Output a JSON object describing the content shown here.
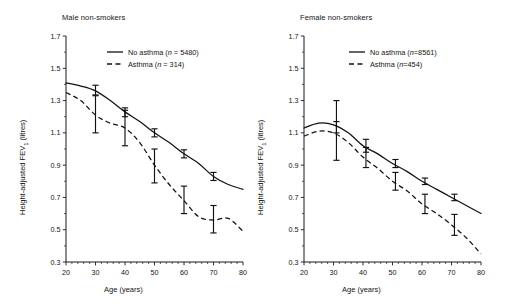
{
  "figure": {
    "panels": [
      {
        "id": "male",
        "title": "Male non-smokers",
        "xlabel": "Age (years)",
        "ylabel_prefix": "Height-adjusted FEV",
        "ylabel_sub": "1",
        "ylabel_suffix": " (litres)",
        "legend": [
          {
            "label": "No asthma (",
            "n_italic": "n",
            "n_value": " = 5480)",
            "style": "solid"
          },
          {
            "label": "Asthma (",
            "n_italic": "n",
            "n_value": " = 314)",
            "style": "dashed"
          }
        ]
      },
      {
        "id": "female",
        "title": "Female non-smokers",
        "xlabel": "Age (years)",
        "ylabel_prefix": "Height-adjusted FEV",
        "ylabel_sub": "1",
        "ylabel_suffix": " (litres)",
        "legend": [
          {
            "label": "No asthma (",
            "n_italic": "n",
            "n_value": "=8561)",
            "style": "solid"
          },
          {
            "label": "Asthma (",
            "n_italic": "n",
            "n_value": "=454)",
            "style": "dashed"
          }
        ]
      }
    ]
  },
  "chart_data": [
    {
      "type": "line",
      "title": "Male non-smokers",
      "xlabel": "Age (years)",
      "ylabel": "Height-adjusted FEV1 (litres)",
      "xlim": [
        20,
        80
      ],
      "ylim": [
        0.3,
        1.7
      ],
      "xticks": [
        20,
        30,
        40,
        50,
        60,
        70,
        80
      ],
      "yticks": [
        0.3,
        0.5,
        0.7,
        0.9,
        1.1,
        1.3,
        1.5,
        1.7
      ],
      "minor_tick_step": 2,
      "grid": false,
      "legend_position": "top-right-inside",
      "series": [
        {
          "name": "No asthma (n = 5480)",
          "style": "solid",
          "x": [
            20,
            25,
            30,
            35,
            40,
            45,
            50,
            55,
            60,
            65,
            70,
            75,
            80
          ],
          "y": [
            1.41,
            1.39,
            1.36,
            1.3,
            1.23,
            1.17,
            1.1,
            1.04,
            0.97,
            0.91,
            0.83,
            0.78,
            0.75
          ],
          "markers": [
            {
              "x": 30,
              "y": 1.36,
              "lo": 1.335,
              "hi": 1.395
            },
            {
              "x": 40,
              "y": 1.23,
              "lo": 1.2,
              "hi": 1.255
            },
            {
              "x": 50,
              "y": 1.1,
              "lo": 1.075,
              "hi": 1.125
            },
            {
              "x": 60,
              "y": 0.97,
              "lo": 0.945,
              "hi": 0.995
            },
            {
              "x": 70,
              "y": 0.83,
              "lo": 0.805,
              "hi": 0.855
            }
          ]
        },
        {
          "name": "Asthma (n = 314)",
          "style": "dashed",
          "x": [
            20,
            25,
            30,
            35,
            40,
            45,
            50,
            55,
            60,
            65,
            70,
            75,
            80
          ],
          "y": [
            1.35,
            1.3,
            1.21,
            1.16,
            1.13,
            1.04,
            0.9,
            0.78,
            0.68,
            0.58,
            0.56,
            0.57,
            0.49
          ],
          "markers": [
            {
              "x": 30,
              "y": 1.21,
              "lo": 1.1,
              "hi": 1.33
            },
            {
              "x": 40,
              "y": 1.13,
              "lo": 1.02,
              "hi": 1.24
            },
            {
              "x": 50,
              "y": 0.9,
              "lo": 0.79,
              "hi": 1.0
            },
            {
              "x": 60,
              "y": 0.68,
              "lo": 0.6,
              "hi": 0.77
            },
            {
              "x": 70,
              "y": 0.56,
              "lo": 0.48,
              "hi": 0.65
            }
          ]
        }
      ]
    },
    {
      "type": "line",
      "title": "Female non-smokers",
      "xlabel": "Age (years)",
      "ylabel": "Height-adjusted FEV1 (litres)",
      "xlim": [
        20,
        80
      ],
      "ylim": [
        0.3,
        1.7
      ],
      "xticks": [
        20,
        30,
        40,
        50,
        60,
        70,
        80
      ],
      "yticks": [
        0.3,
        0.5,
        0.7,
        0.9,
        1.1,
        1.3,
        1.5,
        1.7
      ],
      "minor_tick_step": 2,
      "grid": false,
      "legend_position": "top-right-inside",
      "series": [
        {
          "name": "No asthma (n=8561)",
          "style": "solid",
          "x": [
            20,
            25,
            30,
            35,
            40,
            45,
            50,
            55,
            60,
            65,
            70,
            75,
            80
          ],
          "y": [
            1.13,
            1.16,
            1.15,
            1.1,
            1.02,
            0.97,
            0.91,
            0.86,
            0.8,
            0.75,
            0.7,
            0.65,
            0.6
          ],
          "markers": [
            {
              "x": 31,
              "y": 1.15,
              "lo": 0.93,
              "hi": 1.3
            },
            {
              "x": 41,
              "y": 1.02,
              "lo": 0.98,
              "hi": 1.06
            },
            {
              "x": 51,
              "y": 0.91,
              "lo": 0.885,
              "hi": 0.935
            },
            {
              "x": 61,
              "y": 0.8,
              "lo": 0.78,
              "hi": 0.82
            },
            {
              "x": 71,
              "y": 0.7,
              "lo": 0.68,
              "hi": 0.72
            }
          ]
        },
        {
          "name": "Asthma (n=454)",
          "style": "dashed",
          "x": [
            20,
            25,
            30,
            35,
            40,
            45,
            50,
            55,
            60,
            65,
            70,
            75,
            80
          ],
          "y": [
            1.08,
            1.11,
            1.1,
            1.04,
            0.95,
            0.88,
            0.8,
            0.74,
            0.66,
            0.6,
            0.53,
            0.45,
            0.35
          ],
          "markers": [
            {
              "x": 31,
              "y": 1.135,
              "lo": 1.1,
              "hi": 1.17
            },
            {
              "x": 41,
              "y": 0.95,
              "lo": 0.885,
              "hi": 1.01
            },
            {
              "x": 51,
              "y": 0.8,
              "lo": 0.745,
              "hi": 0.855
            },
            {
              "x": 61,
              "y": 0.66,
              "lo": 0.6,
              "hi": 0.72
            },
            {
              "x": 71,
              "y": 0.53,
              "lo": 0.465,
              "hi": 0.595
            }
          ]
        }
      ]
    }
  ]
}
